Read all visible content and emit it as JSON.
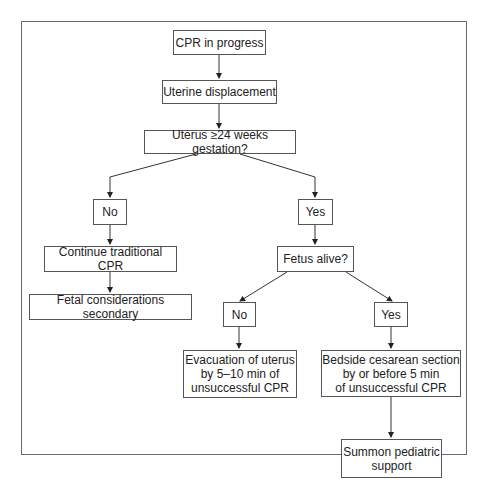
{
  "diagram": {
    "type": "flowchart",
    "nodes": {
      "cpr_in_progress": "CPR in progress",
      "uterine_displacement": "Uterine displacement",
      "uterus_24_weeks": "Uterus ≥24 weeks gestation?",
      "no_1": "No",
      "yes_1": "Yes",
      "continue_cpr": "Continue traditional CPR",
      "fetal_secondary": "Fetal considerations secondary",
      "fetus_alive": "Fetus alive?",
      "no_2": "No",
      "yes_2": "Yes",
      "evacuation_l1": "Evacuation of uterus",
      "evacuation_l2": "by 5–10 min of",
      "evacuation_l3": "unsuccessful CPR",
      "cesarean_l1": "Bedside cesarean section",
      "cesarean_l2": "by or before 5 min",
      "cesarean_l3": "of unsuccessful CPR",
      "pediatric_l1": "Summon pediatric",
      "pediatric_l2": "support"
    },
    "edges": [
      [
        "cpr_in_progress",
        "uterine_displacement"
      ],
      [
        "uterine_displacement",
        "uterus_24_weeks"
      ],
      [
        "uterus_24_weeks",
        "no_1"
      ],
      [
        "uterus_24_weeks",
        "yes_1"
      ],
      [
        "no_1",
        "continue_cpr"
      ],
      [
        "continue_cpr",
        "fetal_secondary"
      ],
      [
        "yes_1",
        "fetus_alive"
      ],
      [
        "fetus_alive",
        "no_2"
      ],
      [
        "fetus_alive",
        "yes_2"
      ],
      [
        "no_2",
        "evacuation"
      ],
      [
        "yes_2",
        "cesarean"
      ],
      [
        "cesarean",
        "pediatric"
      ]
    ]
  }
}
